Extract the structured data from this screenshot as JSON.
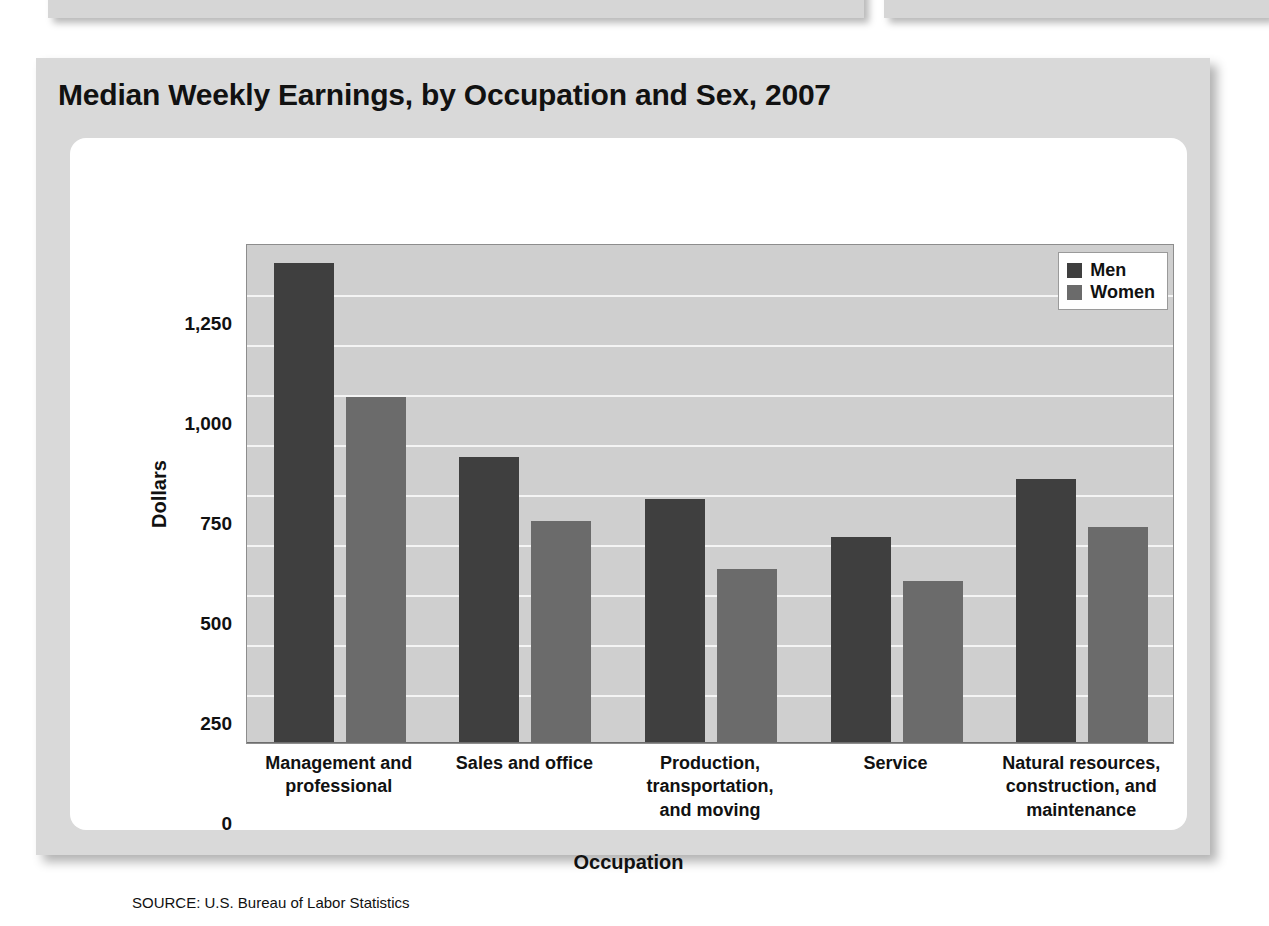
{
  "figure": {
    "title": "Median Weekly Earnings, by Occupation and Sex, 2007",
    "source": "SOURCE: U.S. Bureau of Labor Statistics"
  },
  "top_elements": {
    "left_box": "",
    "right_box": ""
  },
  "colors": {
    "men": "#3f3f3f",
    "women": "#6b6b6b",
    "plot_background": "#cfcfcf",
    "gridline": "#f4f4f4",
    "card_background": "#d9d9d9",
    "panel_background": "#ffffff"
  },
  "chart_data": {
    "type": "bar",
    "title": "Median Weekly Earnings, by Occupation and Sex, 2007",
    "xlabel": "Occupation",
    "ylabel": "Dollars",
    "ylim": [
      0,
      1250
    ],
    "yticks": [
      0,
      250,
      500,
      750,
      1000,
      1250
    ],
    "ytick_labels": [
      "0",
      "250",
      "500",
      "750",
      "1,000",
      "1,250"
    ],
    "gridlines": [
      125,
      250,
      375,
      500,
      625,
      750,
      875,
      1000,
      1125
    ],
    "grid": true,
    "legend_position": "top-right",
    "categories": [
      "Management and\nprofessional",
      "Sales and office",
      "Production,\ntransportation,\nand moving",
      "Service",
      "Natural resources,\nconstruction, and\nmaintenance"
    ],
    "category_lines": [
      [
        "Management and",
        "professional"
      ],
      [
        "Sales and office"
      ],
      [
        "Production,",
        "transportation,",
        "and moving"
      ],
      [
        "Service"
      ],
      [
        "Natural resources,",
        "construction, and",
        "maintenance"
      ]
    ],
    "series": [
      {
        "name": "Men",
        "color": "#3f3f3f",
        "values": [
          1200,
          715,
          610,
          515,
          660
        ]
      },
      {
        "name": "Women",
        "color": "#6b6b6b",
        "values": [
          865,
          555,
          435,
          405,
          540
        ]
      }
    ]
  }
}
